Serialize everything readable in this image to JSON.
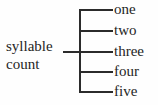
{
  "diagram": {
    "type": "bracket-tree",
    "root": {
      "label_lines": [
        "syllable",
        "count"
      ],
      "full_label": "syllable count"
    },
    "branches": [
      {
        "label": "one"
      },
      {
        "label": "two"
      },
      {
        "label": "three"
      },
      {
        "label": "four"
      },
      {
        "label": "five"
      }
    ],
    "colors": {
      "line": "#2b2b2b",
      "text": "#252525",
      "background": "#fefefe"
    }
  }
}
